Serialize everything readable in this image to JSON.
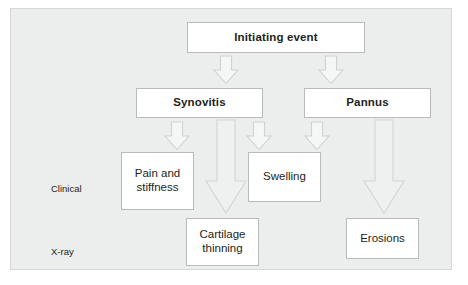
{
  "diagram": {
    "background_color": "#eceded",
    "panel_border_color": "#d6d7d8",
    "box_fill_color": "#ffffff",
    "box_border_color": "#b9bbbd",
    "arrow_fill_color": "#f5f6f6",
    "arrow_stroke_color": "#cfd1d2",
    "text_color": "#231f20"
  },
  "row_labels": [
    {
      "id": "clinical",
      "text": "Clinical"
    },
    {
      "id": "xray",
      "text": "X-ray"
    }
  ],
  "nodes": [
    {
      "id": "initiating-event",
      "label": "Initiating event",
      "emphasis": "bold"
    },
    {
      "id": "synovitis",
      "label": "Synovitis",
      "emphasis": "bold"
    },
    {
      "id": "pannus",
      "label": "Pannus",
      "emphasis": "bold"
    },
    {
      "id": "pain-and-stiffness",
      "label": "Pain and\nstiffness",
      "emphasis": "plain"
    },
    {
      "id": "swelling",
      "label": "Swelling",
      "emphasis": "plain"
    },
    {
      "id": "cartilage-thinning",
      "label": "Cartilage\nthinning",
      "emphasis": "plain"
    },
    {
      "id": "erosions",
      "label": "Erosions",
      "emphasis": "plain"
    }
  ],
  "arrows": [
    {
      "id": "initiating-to-synovitis",
      "size": "small"
    },
    {
      "id": "initiating-to-pannus",
      "size": "small"
    },
    {
      "id": "synovitis-to-pain",
      "size": "small"
    },
    {
      "id": "synovitis-to-swelling",
      "size": "small"
    },
    {
      "id": "pannus-to-swelling",
      "size": "small"
    },
    {
      "id": "synovitis-to-cartilage",
      "size": "large"
    },
    {
      "id": "pannus-to-erosions",
      "size": "large"
    }
  ]
}
